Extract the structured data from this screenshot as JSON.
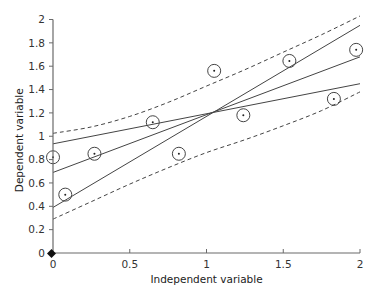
{
  "chart_data": {
    "type": "scatter",
    "title": "",
    "xlabel": "Independent variable",
    "ylabel": "Dependent variable",
    "xlim": [
      0,
      2
    ],
    "ylim": [
      0,
      2
    ],
    "grid": false,
    "legend": null,
    "x_ticks": [
      0,
      0.5,
      1,
      1.5,
      2
    ],
    "x_tick_labels": [
      "0",
      "0.5",
      "1",
      "1.5",
      "2"
    ],
    "y_ticks": [
      0,
      0.2,
      0.4,
      0.6,
      0.8,
      1,
      1.2,
      1.4,
      1.6,
      1.8,
      2
    ],
    "y_tick_labels": [
      "0",
      "0.2",
      "0.4",
      "0.6",
      "0.8",
      "1",
      "1.2",
      "1.4",
      "1.6",
      "1.8",
      "2"
    ],
    "points": [
      {
        "x": 0.0,
        "y": 0.82
      },
      {
        "x": 0.08,
        "y": 0.5
      },
      {
        "x": 0.27,
        "y": 0.85
      },
      {
        "x": 0.65,
        "y": 1.12
      },
      {
        "x": 0.82,
        "y": 0.85
      },
      {
        "x": 1.05,
        "y": 1.56
      },
      {
        "x": 1.24,
        "y": 1.18
      },
      {
        "x": 1.54,
        "y": 1.645
      },
      {
        "x": 1.83,
        "y": 1.32
      },
      {
        "x": 1.975,
        "y": 1.74
      }
    ],
    "origin_marker": {
      "x": 0,
      "y": 0,
      "shape": "diamond"
    },
    "series": [
      {
        "name": "regression line (shallow)",
        "style": "solid",
        "x": [
          0,
          2
        ],
        "y": [
          0.935,
          1.45
        ]
      },
      {
        "name": "regression line (fitted)",
        "style": "solid",
        "x": [
          0,
          2
        ],
        "y": [
          0.69,
          1.68
        ]
      },
      {
        "name": "regression line (steep)",
        "style": "solid",
        "x": [
          0,
          2
        ],
        "y": [
          0.39,
          1.95
        ]
      },
      {
        "name": "upper confidence band",
        "style": "dashed",
        "x": [
          0,
          0.25,
          0.5,
          0.75,
          1.0,
          1.25,
          1.5,
          1.75,
          2.0
        ],
        "y": [
          1.025,
          1.08,
          1.17,
          1.29,
          1.43,
          1.57,
          1.72,
          1.87,
          2.03
        ]
      },
      {
        "name": "lower confidence band",
        "style": "dashed",
        "x": [
          0,
          0.25,
          0.5,
          0.75,
          1.0,
          1.25,
          1.5,
          1.75,
          2.0
        ],
        "y": [
          0.29,
          0.44,
          0.59,
          0.73,
          0.86,
          0.97,
          1.09,
          1.22,
          1.38
        ]
      }
    ]
  }
}
